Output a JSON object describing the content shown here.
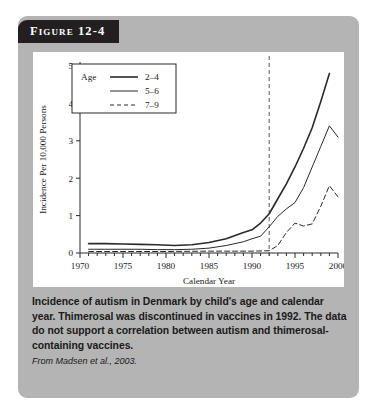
{
  "figure": {
    "tab_label": "Figure 12-4",
    "caption": "Incidence of autism in Denmark by child's age and calendar year. Thimerosal was discontinued in vaccines in 1992. The data do not support a correlation between autism and thimerosal-containing vaccines.",
    "source": "From Madsen et al., 2003."
  },
  "chart_data": {
    "type": "line",
    "title": "",
    "xlabel": "Calendar Year",
    "ylabel": "Incidence Per 10,000 Persons",
    "xlim": [
      1970,
      2000
    ],
    "ylim": [
      0,
      5
    ],
    "xticks": [
      1970,
      1975,
      1980,
      1985,
      1990,
      1995,
      2000
    ],
    "xtick_labels": [
      "1970",
      "1975",
      "1980",
      "1985",
      "1990",
      "1995",
      "2000"
    ],
    "yticks": [
      0,
      1,
      2,
      3,
      4,
      5
    ],
    "ytick_labels": [
      "0",
      "1",
      "2",
      "3",
      "4",
      "5"
    ],
    "minor_xtick_interval": 1,
    "grid": false,
    "legend_position": "upper-left",
    "legend_title": "Age",
    "annotations": [
      {
        "name": "thimerosal-discontinued-line",
        "type": "vertical-reference-line",
        "x": 1992,
        "style": "dashed",
        "label": ""
      }
    ],
    "series": [
      {
        "name": "2-4",
        "label": "2–4",
        "style": "solid",
        "width": 1.6,
        "color": "#2a2a2a",
        "x": [
          1971,
          1973,
          1975,
          1977,
          1979,
          1981,
          1983,
          1985,
          1987,
          1989,
          1990,
          1991,
          1992,
          1993,
          1994,
          1995,
          1996,
          1997,
          1998,
          1999
        ],
        "y": [
          0.25,
          0.25,
          0.24,
          0.23,
          0.22,
          0.2,
          0.22,
          0.28,
          0.38,
          0.55,
          0.62,
          0.8,
          1.05,
          1.45,
          1.85,
          2.3,
          2.8,
          3.35,
          4.05,
          4.8
        ]
      },
      {
        "name": "5-6",
        "label": "5–6",
        "style": "solid",
        "width": 1.0,
        "color": "#2a2a2a",
        "x": [
          1971,
          1973,
          1975,
          1977,
          1979,
          1981,
          1983,
          1985,
          1987,
          1989,
          1990,
          1991,
          1992,
          1993,
          1994,
          1995,
          1996,
          1997,
          1998,
          1999,
          2000
        ],
        "y": [
          0.1,
          0.1,
          0.1,
          0.1,
          0.09,
          0.09,
          0.1,
          0.13,
          0.2,
          0.3,
          0.38,
          0.45,
          0.7,
          0.98,
          1.18,
          1.35,
          1.75,
          2.3,
          2.85,
          3.4,
          3.1
        ]
      },
      {
        "name": "7-9",
        "label": "7–9",
        "style": "dashed",
        "width": 1.0,
        "color": "#2a2a2a",
        "x": [
          1971,
          1975,
          1980,
          1985,
          1988,
          1990,
          1992,
          1993,
          1994,
          1995,
          1996,
          1997,
          1998,
          1999,
          2000
        ],
        "y": [
          0.04,
          0.04,
          0.04,
          0.05,
          0.05,
          0.05,
          0.06,
          0.2,
          0.55,
          0.8,
          0.72,
          0.78,
          1.25,
          1.8,
          1.5
        ]
      }
    ]
  }
}
